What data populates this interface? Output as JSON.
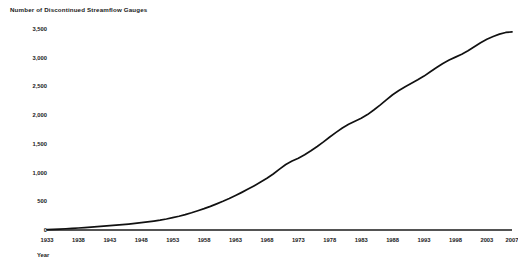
{
  "chart_data": {
    "type": "line",
    "title": "Number of Discontinued Streamflow Gauges",
    "xlabel": "Year",
    "ylabel": "",
    "xlim": [
      1933,
      2007
    ],
    "ylim": [
      0,
      3500
    ],
    "grid": false,
    "legend": null,
    "line_color": "#111111",
    "xticks": [
      1933,
      1938,
      1943,
      1948,
      1953,
      1958,
      1963,
      1968,
      1973,
      1978,
      1983,
      1988,
      1993,
      1998,
      2003,
      2007
    ],
    "xtick_labels": [
      "1933",
      "1938",
      "1943",
      "1948",
      "1953",
      "1958",
      "1963",
      "1968",
      "1973",
      "1978",
      "1983",
      "1988",
      "1993",
      "1998",
      "2003",
      "2007"
    ],
    "yticks": [
      0,
      500,
      1000,
      1500,
      2000,
      2500,
      3000,
      3500
    ],
    "ytick_labels": [
      "0",
      "500",
      "1,000",
      "1,500",
      "2,000",
      "2,500",
      "3,000",
      "3,500"
    ],
    "series": [
      {
        "name": "Discontinued streamflow gauges (cumulative)",
        "x": [
          1933,
          1934,
          1935,
          1936,
          1937,
          1938,
          1939,
          1940,
          1941,
          1942,
          1943,
          1944,
          1945,
          1946,
          1947,
          1948,
          1949,
          1950,
          1951,
          1952,
          1953,
          1954,
          1955,
          1956,
          1957,
          1958,
          1959,
          1960,
          1961,
          1962,
          1963,
          1964,
          1965,
          1966,
          1967,
          1968,
          1969,
          1970,
          1971,
          1972,
          1973,
          1974,
          1975,
          1976,
          1977,
          1978,
          1979,
          1980,
          1981,
          1982,
          1983,
          1984,
          1985,
          1986,
          1987,
          1988,
          1989,
          1990,
          1991,
          1992,
          1993,
          1994,
          1995,
          1996,
          1997,
          1998,
          1999,
          2000,
          2001,
          2002,
          2003,
          2004,
          2005,
          2006,
          2007
        ],
        "values": [
          5,
          10,
          16,
          22,
          28,
          35,
          42,
          50,
          58,
          66,
          75,
          84,
          94,
          104,
          115,
          127,
          140,
          155,
          172,
          192,
          215,
          240,
          268,
          300,
          335,
          372,
          412,
          455,
          500,
          548,
          600,
          655,
          712,
          772,
          835,
          900,
          975,
          1060,
          1140,
          1200,
          1250,
          1310,
          1380,
          1455,
          1535,
          1620,
          1700,
          1775,
          1840,
          1895,
          1945,
          2010,
          2090,
          2175,
          2265,
          2355,
          2430,
          2495,
          2555,
          2615,
          2680,
          2755,
          2830,
          2900,
          2960,
          3010,
          3060,
          3120,
          3190,
          3260,
          3320,
          3370,
          3410,
          3440,
          3450
        ]
      }
    ]
  },
  "footer": {
    "note": ""
  }
}
